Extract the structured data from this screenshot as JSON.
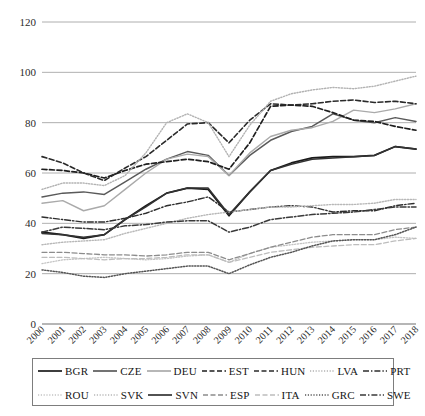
{
  "chart_data": {
    "type": "line",
    "title": "",
    "subtitle": "",
    "xlabel": "",
    "ylabel": "",
    "xlim": [
      2000,
      2018
    ],
    "ylim": [
      0,
      120
    ],
    "yticks": [
      0,
      20,
      40,
      60,
      80,
      100,
      120
    ],
    "grid": true,
    "legend_position": "bottom",
    "x": [
      2000,
      2001,
      2002,
      2003,
      2004,
      2005,
      2006,
      2007,
      2008,
      2009,
      2010,
      2011,
      2012,
      2013,
      2014,
      2015,
      2016,
      2017,
      2018
    ],
    "categories": [
      "2000",
      "2001",
      "2002",
      "2003",
      "2004",
      "2005",
      "2006",
      "2007",
      "2008",
      "2009",
      "2010",
      "2011",
      "2012",
      "2013",
      "2014",
      "2015",
      "2016",
      "2017",
      "2018"
    ],
    "series": [
      {
        "name": "BGR",
        "style": "solid",
        "color": "#1a1a1a",
        "width": 1.7,
        "values": [
          36.5,
          35.5,
          34.0,
          35.5,
          41.5,
          47.0,
          52.0,
          54.0,
          53.5,
          43.0,
          52.5,
          61.0,
          64.0,
          66.0,
          66.5,
          66.5,
          67.0,
          70.5,
          69.5
        ]
      },
      {
        "name": "CZE",
        "style": "solid",
        "color": "#5a5a5a",
        "width": 1.5,
        "values": [
          50.5,
          52.0,
          52.5,
          51.5,
          56.5,
          61.5,
          65.5,
          68.5,
          67.0,
          59.0,
          67.0,
          73.0,
          76.5,
          78.5,
          83.5,
          81.0,
          80.0,
          82.0,
          80.5
        ]
      },
      {
        "name": "DEU",
        "style": "solid",
        "color": "#aaaaaa",
        "width": 1.4,
        "values": [
          48.0,
          49.0,
          45.0,
          47.0,
          53.5,
          60.0,
          65.5,
          67.5,
          66.5,
          59.0,
          68.0,
          74.5,
          77.0,
          78.0,
          80.5,
          85.0,
          84.0,
          85.5,
          87.5
        ]
      },
      {
        "name": "EST",
        "style": "dashed",
        "color": "#1e1e1e",
        "width": 1.7,
        "values": [
          61.5,
          61.0,
          60.0,
          58.0,
          61.0,
          63.5,
          64.5,
          65.5,
          64.5,
          61.5,
          72.0,
          86.5,
          87.0,
          86.5,
          84.0,
          81.0,
          80.5,
          78.5,
          77.0
        ]
      },
      {
        "name": "HUN",
        "style": "dashed",
        "color": "#2a2a2a",
        "width": 1.6,
        "values": [
          66.5,
          64.0,
          60.0,
          57.0,
          62.0,
          66.5,
          73.0,
          79.5,
          80.0,
          72.0,
          81.0,
          87.5,
          87.0,
          87.5,
          88.5,
          89.0,
          88.0,
          88.5,
          87.5
        ]
      },
      {
        "name": "LVA",
        "style": "dotted",
        "color": "#b2b2b2",
        "width": 1.4,
        "values": [
          53.5,
          56.0,
          56.0,
          55.0,
          59.0,
          68.0,
          80.0,
          83.5,
          80.0,
          66.5,
          79.0,
          88.5,
          91.5,
          93.0,
          94.0,
          93.5,
          94.5,
          96.5,
          98.5
        ]
      },
      {
        "name": "PRT",
        "style": "dashdot",
        "color": "#2e2e2e",
        "width": 1.4,
        "values": [
          42.5,
          41.5,
          40.5,
          40.5,
          42.0,
          44.0,
          47.0,
          48.5,
          50.5,
          44.5,
          45.5,
          46.5,
          47.0,
          46.5,
          44.5,
          45.0,
          45.0,
          47.0,
          48.0
        ]
      },
      {
        "name": "ROU",
        "style": "dotted",
        "color": "#c4c4c4",
        "width": 1.3,
        "values": [
          24.0,
          25.5,
          26.0,
          26.5,
          26.0,
          25.5,
          26.0,
          27.0,
          27.5,
          24.5,
          28.0,
          30.5,
          31.5,
          32.5,
          33.0,
          33.5,
          33.5,
          34.5,
          34.0
        ]
      },
      {
        "name": "SVK",
        "style": "dotted",
        "color": "#b8b8b8",
        "width": 1.4,
        "values": [
          31.5,
          32.5,
          33.0,
          33.5,
          36.0,
          38.0,
          40.0,
          42.0,
          43.5,
          44.5,
          45.5,
          46.5,
          46.5,
          47.0,
          47.5,
          47.5,
          48.0,
          49.5,
          49.5
        ]
      },
      {
        "name": "SVN",
        "style": "solid",
        "color": "#333333",
        "width": 1.5,
        "values": [
          36.0,
          35.5,
          34.5,
          35.5,
          41.5,
          46.5,
          52.0,
          54.0,
          54.0,
          43.5,
          52.5,
          61.0,
          63.5,
          65.5,
          66.0,
          66.5,
          67.0,
          70.5,
          69.5
        ]
      },
      {
        "name": "ESP",
        "style": "dashed",
        "color": "#8c8c8c",
        "width": 1.3,
        "values": [
          28.5,
          28.5,
          28.0,
          27.5,
          27.5,
          27.0,
          27.5,
          28.5,
          28.5,
          25.5,
          28.0,
          30.5,
          32.5,
          34.5,
          35.5,
          35.5,
          35.5,
          37.5,
          38.5
        ]
      },
      {
        "name": "ITA",
        "style": "dashed",
        "color": "#bdbdbd",
        "width": 1.3,
        "values": [
          26.5,
          26.5,
          26.0,
          25.5,
          26.0,
          26.0,
          26.5,
          27.5,
          27.5,
          24.5,
          26.5,
          28.5,
          29.5,
          30.5,
          31.0,
          31.5,
          31.5,
          33.0,
          34.0
        ]
      },
      {
        "name": "GRC",
        "style": "dotted",
        "color": "#555555",
        "width": 1.5,
        "values": [
          21.5,
          20.5,
          19.0,
          18.5,
          20.0,
          21.0,
          22.0,
          23.0,
          23.0,
          20.0,
          23.5,
          26.5,
          28.5,
          31.0,
          33.0,
          33.5,
          33.5,
          35.5,
          38.5
        ]
      },
      {
        "name": "SWE",
        "style": "dashdot",
        "color": "#3a3a3a",
        "width": 1.5,
        "values": [
          36.5,
          38.5,
          38.0,
          37.5,
          39.0,
          39.5,
          40.5,
          41.0,
          41.0,
          36.5,
          38.5,
          41.5,
          42.5,
          43.5,
          44.0,
          44.5,
          45.5,
          46.5,
          46.5
        ]
      }
    ]
  },
  "axes": {
    "y_tick_labels": [
      "120",
      "100",
      "80",
      "60",
      "40",
      "20",
      "0"
    ],
    "x_tick_labels": [
      "2000",
      "2001",
      "2002",
      "2003",
      "2004",
      "2005",
      "2006",
      "2007",
      "2008",
      "2009",
      "2010",
      "2011",
      "2012",
      "2013",
      "2014",
      "2015",
      "2016",
      "2017",
      "2018"
    ]
  },
  "legend": {
    "row1": [
      {
        "label": "BGR",
        "style": "solid",
        "color": "#1a1a1a"
      },
      {
        "label": "CZE",
        "style": "solid",
        "color": "#5a5a5a"
      },
      {
        "label": "DEU",
        "style": "solid",
        "color": "#aaaaaa"
      },
      {
        "label": "EST",
        "style": "dashed",
        "color": "#1e1e1e"
      },
      {
        "label": "HUN",
        "style": "dashed",
        "color": "#2a2a2a"
      },
      {
        "label": "LVA",
        "style": "dotted",
        "color": "#b2b2b2"
      },
      {
        "label": "PRT",
        "style": "dashdot",
        "color": "#2e2e2e"
      }
    ],
    "row2": [
      {
        "label": "ROU",
        "style": "dotted",
        "color": "#c4c4c4"
      },
      {
        "label": "SVK",
        "style": "dotted",
        "color": "#b8b8b8"
      },
      {
        "label": "SVN",
        "style": "solid",
        "color": "#333333"
      },
      {
        "label": "ESP",
        "style": "dashed",
        "color": "#8c8c8c"
      },
      {
        "label": "ITA",
        "style": "dashed",
        "color": "#bdbdbd"
      },
      {
        "label": "GRC",
        "style": "dotted",
        "color": "#555555"
      },
      {
        "label": "SWE",
        "style": "dashdot",
        "color": "#3a3a3a"
      }
    ]
  }
}
